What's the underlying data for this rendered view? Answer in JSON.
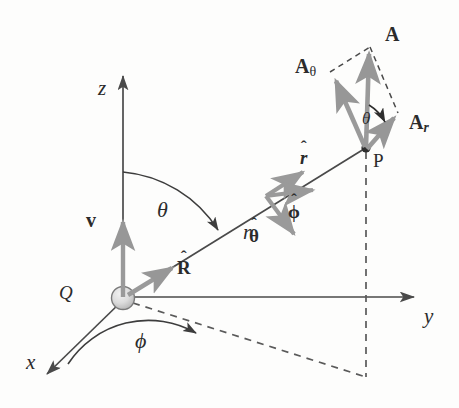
{
  "figure": {
    "background_color": "#fdfdfc",
    "axis_color": "#4a4a4a",
    "vector_color": "#9a9a9a",
    "dark_vector_color": "#8c8c8c",
    "dashed_color": "#5a5a5a",
    "label_color": "#2b2b2b",
    "origin_fill": "#d8d8d8"
  },
  "axes": [
    {
      "name": "z-axis",
      "label": "z",
      "label_x": 98,
      "label_y": 78,
      "style": "italic"
    },
    {
      "name": "y-axis",
      "label": "y",
      "label_x": 424,
      "label_y": 306,
      "style": "italic"
    },
    {
      "name": "x-axis",
      "label": "x",
      "label_x": 26,
      "label_y": 352,
      "style": "italic"
    }
  ],
  "points": [
    {
      "name": "origin-charge",
      "label": "Q",
      "label_x": 59,
      "label_y": 283,
      "style": "italic"
    },
    {
      "name": "field-point",
      "label": "P",
      "label_x": 373,
      "label_y": 151,
      "style": "upright"
    }
  ],
  "angles": [
    {
      "name": "theta-polar-angle",
      "label": "θ",
      "label_x": 157,
      "label_y": 199,
      "desc": "polar angle from z-axis to r"
    },
    {
      "name": "phi-azimuthal-angle",
      "label": "ϕ",
      "label_x": 135,
      "label_y": 330,
      "desc": "azimuthal angle from x-axis"
    },
    {
      "name": "theta-at-P",
      "label": "θ",
      "label_x": 362,
      "label_y": 110,
      "desc": "angle at P between A and A_r"
    }
  ],
  "distances": [
    {
      "name": "radial-distance",
      "label": "r",
      "label_x": 243,
      "label_y": 222,
      "style": "italic"
    }
  ],
  "vectors": [
    {
      "name": "vector-A",
      "label": "A",
      "label_x": 385,
      "label_y": 24,
      "kind": "bold"
    },
    {
      "name": "vector-A-theta",
      "label": "A",
      "sub": "θ",
      "sub_kind": "greek",
      "label_x": 295,
      "label_y": 56,
      "kind": "bold"
    },
    {
      "name": "vector-A-r",
      "label": "A",
      "sub": "r",
      "sub_kind": "italic",
      "label_x": 409,
      "label_y": 112,
      "kind": "bold"
    },
    {
      "name": "vector-v",
      "label": "v",
      "label_x": 86,
      "label_y": 210,
      "kind": "bold"
    }
  ],
  "unit_vectors": [
    {
      "name": "unit-vector-R-hat",
      "label": "R",
      "hat": true,
      "label_x": 177,
      "label_y": 258,
      "kind": "bold"
    },
    {
      "name": "unit-vector-r-hat",
      "label": "r",
      "hat": true,
      "label_x": 300,
      "label_y": 148,
      "kind": "bold"
    },
    {
      "name": "unit-vector-phi-hat",
      "label": "ϕ",
      "hat": true,
      "label_x": 288,
      "label_y": 202,
      "kind": "bold-greek"
    },
    {
      "name": "unit-vector-theta-hat",
      "label": "θ",
      "hat": true,
      "label_x": 249,
      "label_y": 226,
      "kind": "bold-greek"
    }
  ],
  "geometry": {
    "origin": {
      "x": 123,
      "y": 298
    },
    "point_P": {
      "x": 366,
      "y": 148
    },
    "z_axis_tip": {
      "x": 123,
      "y": 70
    },
    "y_axis_tip": {
      "x": 420,
      "y": 297
    },
    "x_axis_tip": {
      "x": 42,
      "y": 379
    },
    "projection_point": {
      "x": 366,
      "y": 377
    }
  }
}
